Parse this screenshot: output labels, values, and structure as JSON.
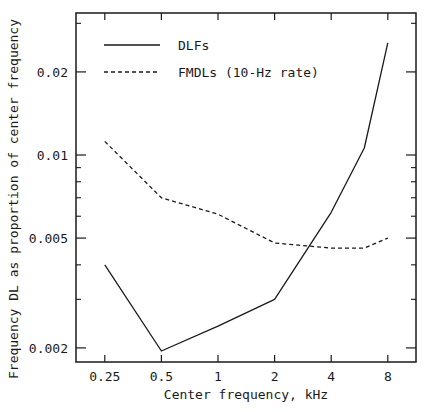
{
  "chart_data": {
    "type": "line",
    "title": "",
    "xlabel": "Center frequency, kHz",
    "ylabel": "Frequency DL as proportion of center frequency",
    "xscale": "log",
    "yscale": "log",
    "xlim": [
      0.2,
      10
    ],
    "ylim": [
      0.0019,
      0.034
    ],
    "grid": false,
    "legend_position": "upper-left",
    "x_ticks": [
      0.25,
      0.5,
      1,
      2,
      4,
      8
    ],
    "x_tick_labels": [
      "0.25",
      "0.5",
      "1",
      "2",
      "4",
      "8"
    ],
    "y_ticks": [
      0.002,
      0.005,
      0.01,
      0.02
    ],
    "y_tick_labels": [
      "0.002",
      "0.005",
      "0.01",
      "0.02"
    ],
    "y_minor_ticks": [
      0.003,
      0.004,
      0.006,
      0.007,
      0.008,
      0.009,
      0.03
    ],
    "series": [
      {
        "name": "DLFs",
        "style": "solid",
        "x": [
          0.25,
          0.5,
          1,
          2,
          4,
          6,
          8
        ],
        "values": [
          0.004,
          0.00195,
          0.0024,
          0.003,
          0.0062,
          0.0106,
          0.0255
        ]
      },
      {
        "name": "FMDLs (10-Hz rate)",
        "style": "dashed",
        "x": [
          0.25,
          0.5,
          1,
          2,
          4,
          6,
          8
        ],
        "values": [
          0.0112,
          0.007,
          0.0061,
          0.0048,
          0.0046,
          0.0046,
          0.005
        ]
      }
    ]
  },
  "colors": {
    "line": "#1a1a1a",
    "background": "#ffffff"
  }
}
